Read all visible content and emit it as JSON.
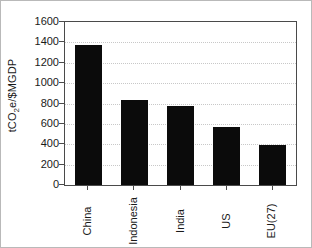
{
  "chart_data": {
    "type": "bar",
    "title": "",
    "xlabel": "",
    "ylabel": "tCO2e/$MGDP",
    "ylabel_parts": {
      "pre": "tCO",
      "sub": "2",
      "post": "e/$MGDP"
    },
    "categories": [
      "China",
      "Indonesia",
      "India",
      "US",
      "EU(27)"
    ],
    "values": [
      1374,
      834,
      775,
      569,
      393
    ],
    "ylim": [
      0,
      1600
    ],
    "ytick_values": [
      0,
      200,
      400,
      600,
      800,
      1000,
      1200,
      1400,
      1600
    ],
    "ytick_labels": [
      "0",
      "200",
      "400",
      "600",
      "800",
      "1000",
      "1200",
      "1400",
      "1600"
    ],
    "grid": true,
    "grid_axis": "y",
    "grid_style": "dotted",
    "legend": false,
    "legend_position": "none",
    "bar_color": "#0b0b0b",
    "axis_color": "#4a4a4a",
    "grid_color": "#c8c8c8",
    "background_color": "#ffffff",
    "border_color": "#b9b9b9",
    "xtick_label_rotation": 90
  }
}
